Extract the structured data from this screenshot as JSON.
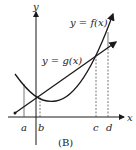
{
  "figure": {
    "caption": "(B)",
    "axis_labels": {
      "x": "x",
      "y": "y"
    },
    "curve_labels": {
      "f": "y = f(x)",
      "g": "y = g(x)"
    },
    "tick_labels": [
      "a",
      "b",
      "c",
      "d"
    ],
    "colors": {
      "ink": "#1a1a1a",
      "background": "#ffffff"
    }
  }
}
